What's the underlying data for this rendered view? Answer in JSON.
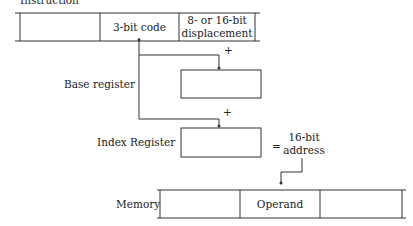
{
  "diagram": {
    "type": "addressing-mode-diagram",
    "instruction": {
      "label": "Instruction",
      "fields": [
        "",
        "3-bit code",
        "8- or 16-bit displacement"
      ],
      "field_line1": "8- or 16-bit",
      "field_line2": "displacement"
    },
    "base_register": {
      "label": "Base register",
      "plus": "+"
    },
    "index_register": {
      "label": "Index Register",
      "plus": "+"
    },
    "result": {
      "equals": "=",
      "line1": "16-bit",
      "line2": "address"
    },
    "memory": {
      "label": "Memory",
      "cells": [
        "",
        "Operand",
        ""
      ]
    },
    "colors": {
      "line": "#333333",
      "text": "#222222",
      "background": "#ffffff"
    }
  }
}
